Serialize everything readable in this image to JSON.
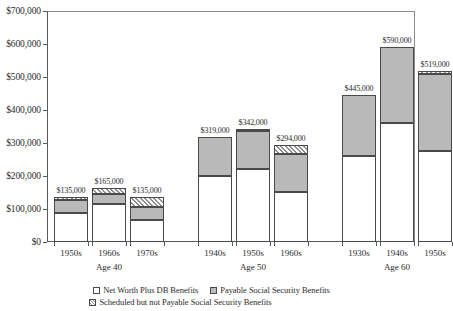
{
  "chart_data": {
    "type": "bar",
    "subtype": "stacked-grouped",
    "title": "",
    "xlabel": "",
    "ylabel": "",
    "ylim": [
      0,
      700000
    ],
    "ytick_labels": [
      "$0",
      "$100,000",
      "$200,000",
      "$300,000",
      "$400,000",
      "$500,000",
      "$600,000",
      "$700,000"
    ],
    "ytick_values": [
      0,
      100000,
      200000,
      300000,
      400000,
      500000,
      600000,
      700000
    ],
    "grid": false,
    "legend_position": "bottom",
    "groups": [
      {
        "group_label": "Age 40",
        "categories": [
          "1950s",
          "1960s",
          "1970s"
        ]
      },
      {
        "group_label": "Age 50",
        "categories": [
          "1940s",
          "1950s",
          "1960s"
        ]
      },
      {
        "group_label": "Age 60",
        "categories": [
          "1930s",
          "1940s",
          "1950s"
        ]
      }
    ],
    "categories": [
      "1950s",
      "1960s",
      "1970s",
      "1940s",
      "1950s",
      "1960s",
      "1930s",
      "1940s",
      "1950s"
    ],
    "series": [
      {
        "name": "Net Worth Plus DB Benefits",
        "values": [
          88000,
          115000,
          68000,
          200000,
          222000,
          152000,
          262000,
          360000,
          277000
        ]
      },
      {
        "name": "Payable Social Security Benefits",
        "values": [
          40000,
          32000,
          39000,
          119000,
          113000,
          114000,
          183000,
          230000,
          231000
        ]
      },
      {
        "name": "Scheduled but not Payable Social Security Benefits",
        "values": [
          7000,
          18000,
          28000,
          0,
          7000,
          28000,
          0,
          0,
          11000
        ]
      }
    ],
    "totals": [
      135000,
      165000,
      135000,
      319000,
      342000,
      294000,
      445000,
      590000,
      519000
    ],
    "total_labels": [
      "$135,000",
      "$165,000",
      "$135,000",
      "$319,000",
      "$342,000",
      "$294,000",
      "$445,000",
      "$590,000",
      "$519,000"
    ],
    "colors": {
      "net_worth": "#ffffff",
      "payable": "#b9b9b9",
      "scheduled": "#ffffff",
      "outline": "#4a4a4a",
      "axis": "#5a5a5a",
      "text": "#2b2b2b"
    },
    "legend": [
      "Net Worth Plus DB Benefits",
      "Payable Social Security Benefits",
      "Scheduled but not Payable Social Security Benefits"
    ]
  }
}
